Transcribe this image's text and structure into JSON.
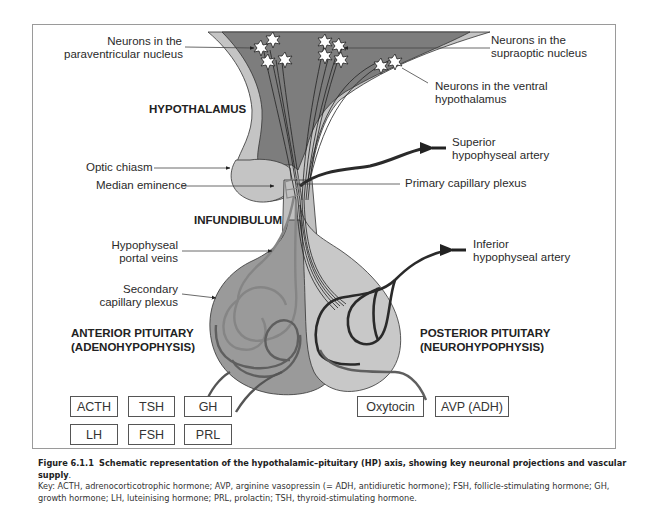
{
  "diagram": {
    "title": "Schematic representation of the hypothalamic–pituitary (HP) axis",
    "colors": {
      "hypothalamus_dark": "#7d7d7d",
      "hypothalamus_light": "#c4c4c4",
      "anterior_pituitary": "#9a9a9a",
      "posterior_pituitary": "#c8c8c8",
      "vessel_dark": "#333333",
      "vessel_gray": "#6e6e6e",
      "portal_light": "#8a8a8a",
      "frame": "#9a9a9a"
    },
    "regions": {
      "hypothalamus": "HYPOTHALAMUS",
      "infundibulum": "INFUNDIBULUM",
      "anterior_line1": "ANTERIOR PITUITARY",
      "anterior_line2": "(ADENOHYPOPHYSIS)",
      "posterior_line1": "POSTERIOR PITUITARY",
      "posterior_line2": "(NEUROHYPOPHYSIS)"
    },
    "labels": {
      "paraventricular_1": "Neurons in the",
      "paraventricular_2": "paraventricular nucleus",
      "supraoptic_1": "Neurons in the",
      "supraoptic_2": "supraoptic nucleus",
      "ventral_1": "Neurons in the ventral",
      "ventral_2": "hypothalamus",
      "superior_artery_1": "Superior",
      "superior_artery_2": "hypophyseal artery",
      "primary_plexus": "Primary capillary plexus",
      "optic_chiasm": "Optic chiasm",
      "median_eminence": "Median eminence",
      "portal_veins_1": "Hypophyseal",
      "portal_veins_2": "portal veins",
      "secondary_plexus_1": "Secondary",
      "secondary_plexus_2": "capillary plexus",
      "inferior_artery_1": "Inferior",
      "inferior_artery_2": "hypophyseal artery"
    },
    "anterior_hormones": [
      "ACTH",
      "TSH",
      "GH",
      "LH",
      "FSH",
      "PRL"
    ],
    "posterior_hormones": [
      "Oxytocin",
      "AVP (ADH)"
    ]
  },
  "caption": {
    "figure_number": "Figure 6.1.1",
    "title": "Schematic representation of the hypothalamic–pituitary (HP) axis, showing key neuronal projections and vascular supply",
    "key": "Key: ACTH, adrenocorticotrophic hormone; AVP, arginine vasopressin (= ADH, antidiuretic hormone); FSH, follicle-stimulating hormone; GH, growth hormone; LH, luteinising hormone; PRL, prolactin; TSH, thyroid-stimulating hormone."
  }
}
